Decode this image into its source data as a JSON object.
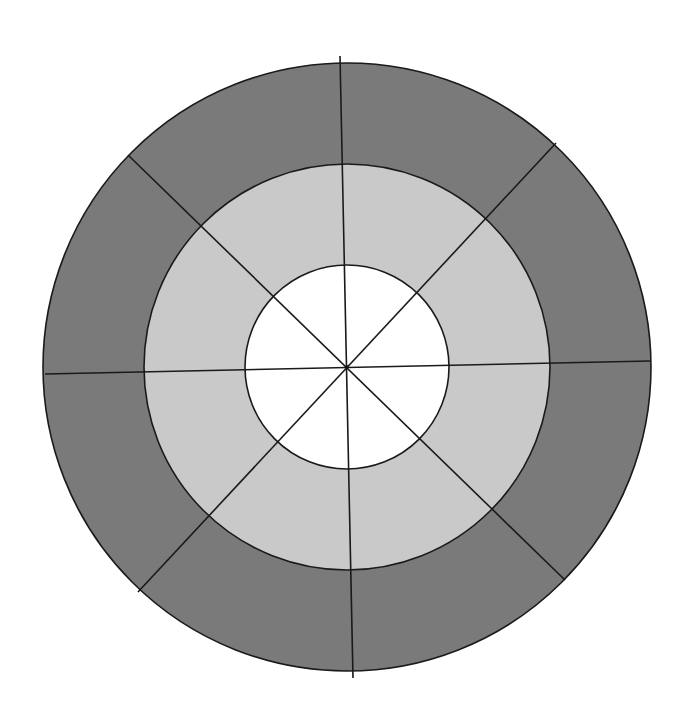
{
  "diagram": {
    "type": "concentric-sector-diagram",
    "canvas": {
      "width": 690,
      "height": 718,
      "background": "#ffffff"
    },
    "center": {
      "x": 347,
      "y": 367
    },
    "rings": [
      {
        "name": "outer-ring",
        "radius": 304,
        "fill": "#7a7a7a"
      },
      {
        "name": "middle-ring",
        "radius": 203,
        "fill": "#c9c9c9"
      },
      {
        "name": "inner-disc",
        "radius": 102,
        "fill": "#ffffff"
      }
    ],
    "stroke": {
      "color": "#1a1a1a",
      "width": 1.6
    },
    "sector_count": 8,
    "divider_lines": [
      {
        "name": "vertical-divider",
        "x1": 340,
        "y1": 56,
        "x2": 353,
        "y2": 678
      },
      {
        "name": "horizontal-divider",
        "x1": 45,
        "y1": 374,
        "x2": 650,
        "y2": 361
      },
      {
        "name": "diagonal-divider-nw-se",
        "x1": 128,
        "y1": 155,
        "x2": 565,
        "y2": 580
      },
      {
        "name": "diagonal-divider-ne-sw",
        "x1": 556,
        "y1": 143,
        "x2": 138,
        "y2": 592
      }
    ]
  }
}
